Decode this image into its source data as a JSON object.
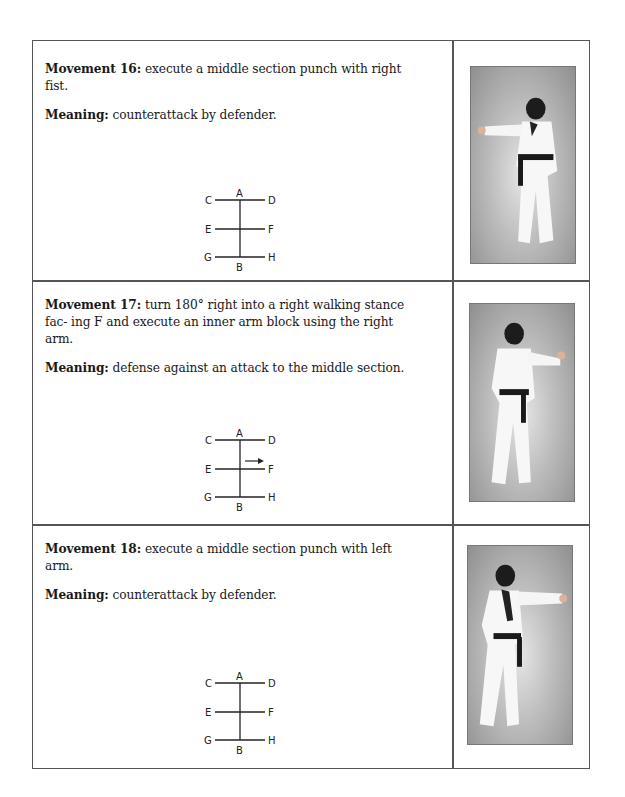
{
  "movements": [
    {
      "label": "Movement 16:",
      "description": "execute a middle section punch with right fist.",
      "meaning_label": "Meaning:",
      "meaning": "counterattack by defender.",
      "diagram": {
        "labels": {
          "A": "A",
          "B": "B",
          "C": "C",
          "D": "D",
          "E": "E",
          "F": "F",
          "G": "G",
          "H": "H"
        },
        "arrow": false
      },
      "photo": "practitioner-punch-right-fist"
    },
    {
      "label": "Movement 17:",
      "description": "turn 180° right into a right walking stance fac- ing F and execute an inner arm block using the right arm.",
      "meaning_label": "Meaning:",
      "meaning": "defense against an attack to the middle section.",
      "diagram": {
        "labels": {
          "A": "A",
          "B": "B",
          "C": "C",
          "D": "D",
          "E": "E",
          "F": "F",
          "G": "G",
          "H": "H"
        },
        "arrow": true,
        "arrow_direction": "toward F"
      },
      "photo": "practitioner-inner-arm-block"
    },
    {
      "label": "Movement 18:",
      "description": "execute a middle section punch with left arm.",
      "meaning_label": "Meaning:",
      "meaning": "counterattack by defender.",
      "diagram": {
        "labels": {
          "A": "A",
          "B": "B",
          "C": "C",
          "D": "D",
          "E": "E",
          "F": "F",
          "G": "G",
          "H": "H"
        },
        "arrow": false
      },
      "photo": "practitioner-punch-left-arm"
    }
  ]
}
